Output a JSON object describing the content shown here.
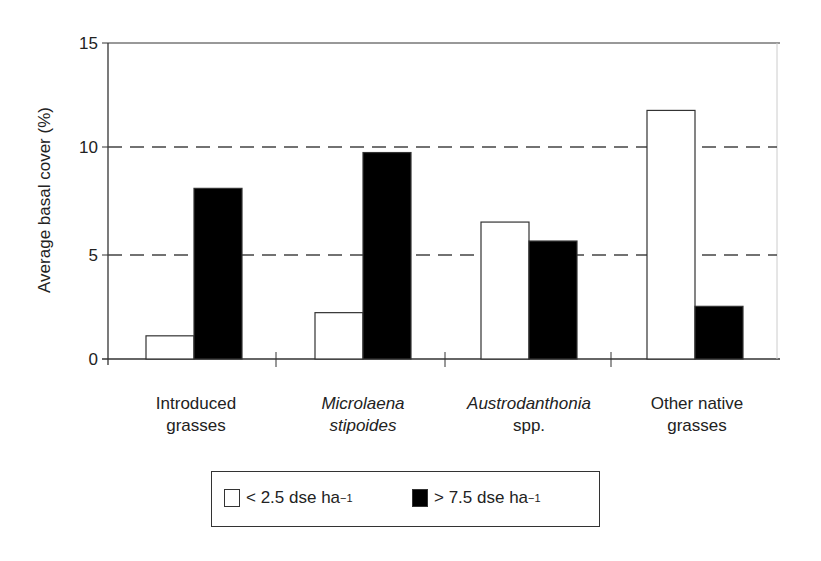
{
  "chart_data": {
    "type": "bar",
    "title": "",
    "xlabel": "",
    "ylabel": "Average basal cover (%)",
    "ylim": [
      0,
      15
    ],
    "yticks": [
      0,
      5,
      10,
      15
    ],
    "grid": "dashed at 5 and 10",
    "categories": [
      "Introduced grasses",
      "Microlaena stipoides",
      "Austrodanthonia spp.",
      "Other native grasses"
    ],
    "series": [
      {
        "name": "< 2.5 dse ha-1",
        "color": "#ffffff",
        "values": [
          1.1,
          2.2,
          6.5,
          11.8
        ]
      },
      {
        "name": "> 7.5 dse ha-1",
        "color": "#000000",
        "values": [
          8.1,
          9.8,
          5.6,
          2.5
        ]
      }
    ],
    "legend_position": "bottom"
  },
  "labels": {
    "ytitle": "Average basal cover (%)",
    "yticks": [
      "15",
      "10",
      "5",
      "0"
    ],
    "cats": [
      [
        "Introduced",
        "grasses"
      ],
      [
        "Microlaena",
        "stipoides"
      ],
      [
        "Austrodanthonia",
        "spp."
      ],
      [
        "Other native",
        "grasses"
      ]
    ],
    "legend": [
      {
        "text": "< 2.5 dse ha",
        "sup": "−1"
      },
      {
        "text": "> 7.5 dse ha",
        "sup": "−1"
      }
    ]
  }
}
